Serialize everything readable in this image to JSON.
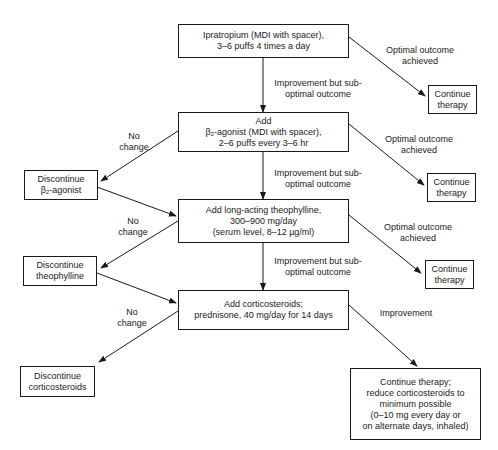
{
  "diagram": {
    "type": "flowchart",
    "main_steps": [
      {
        "id": "step1",
        "lines": [
          "Ipratropium (MDI with spacer),",
          "3–6 puffs 4 times a day"
        ]
      },
      {
        "id": "step2",
        "lines": [
          "Add",
          "β₂-agonist (MDI with spacer),",
          "2–6 puffs every 3–6 hr"
        ]
      },
      {
        "id": "step3",
        "lines": [
          "Add long-acting theophylline,",
          "300–900 mg/day",
          "(serum level, 8–12 µg/ml)"
        ]
      },
      {
        "id": "step4",
        "lines": [
          "Add corticosteroids;",
          "prednisone, 40 mg/day for 14 days"
        ]
      }
    ],
    "continue_boxes": [
      {
        "id": "cont1",
        "lines": [
          "Continue",
          "therapy"
        ]
      },
      {
        "id": "cont2",
        "lines": [
          "Continue",
          "therapy"
        ]
      },
      {
        "id": "cont3",
        "lines": [
          "Continue",
          "therapy"
        ]
      },
      {
        "id": "cont4",
        "lines": [
          "Continue therapy;",
          "reduce corticosteroids to",
          "minimum possible",
          "(0–10 mg every day or",
          "on alternate days, inhaled)"
        ]
      }
    ],
    "discontinue_boxes": [
      {
        "id": "disc1",
        "lines": [
          "Discontinue",
          "β₂-agonist"
        ]
      },
      {
        "id": "disc2",
        "lines": [
          "Discontinue",
          "theophylline"
        ]
      },
      {
        "id": "disc3",
        "lines": [
          "Discontinue",
          "corticosteroids"
        ]
      }
    ],
    "edge_labels": {
      "suboptimal": [
        "Improvement but sub-",
        "optimal outcome"
      ],
      "optimal": [
        "Optimal outcome",
        "achieved"
      ],
      "no_change": [
        "No",
        "change"
      ],
      "improvement": [
        "Improvement"
      ]
    },
    "edges": [
      {
        "from": "step1",
        "to": "step2",
        "label": "Improvement but sub-optimal outcome"
      },
      {
        "from": "step1",
        "to": "cont1",
        "label": "Optimal outcome achieved"
      },
      {
        "from": "step2",
        "to": "step3",
        "label": "Improvement but sub-optimal outcome"
      },
      {
        "from": "step2",
        "to": "cont2",
        "label": "Optimal outcome achieved"
      },
      {
        "from": "step2",
        "to": "disc1",
        "label": "No change"
      },
      {
        "from": "disc1",
        "to": "step3",
        "label": ""
      },
      {
        "from": "step3",
        "to": "step4",
        "label": "Improvement but sub-optimal outcome"
      },
      {
        "from": "step3",
        "to": "cont3",
        "label": "Optimal outcome achieved"
      },
      {
        "from": "step3",
        "to": "disc2",
        "label": "No change"
      },
      {
        "from": "disc2",
        "to": "step4",
        "label": ""
      },
      {
        "from": "step4",
        "to": "cont4",
        "label": "Improvement"
      },
      {
        "from": "step4",
        "to": "disc3",
        "label": "No change"
      }
    ]
  }
}
